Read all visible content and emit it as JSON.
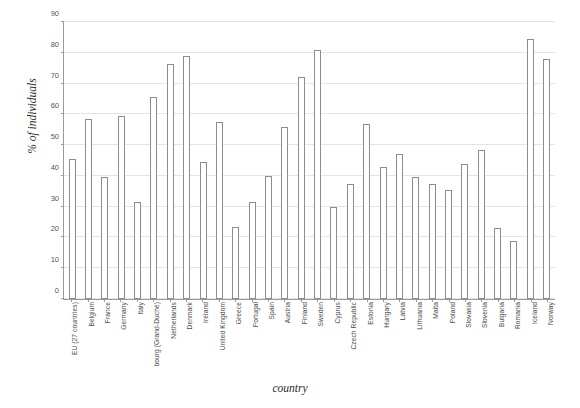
{
  "chart_data": {
    "type": "bar",
    "title": "",
    "xlabel": "country",
    "ylabel": "% of individuals",
    "ylim": [
      0,
      90
    ],
    "ytick_step": 10,
    "yticks": [
      0,
      10,
      20,
      30,
      40,
      50,
      60,
      70,
      80,
      90
    ],
    "grid": true,
    "legend": "none",
    "bar_fill_color": "#ffffff",
    "bar_border_color": "#8d8d8d",
    "gridline_color": "#e4e4e4",
    "axis_color": "#9a9a9a",
    "categories": [
      "EU (27 countries)",
      "Belgium",
      "France",
      "Germany",
      "Italy",
      "bourg (Grand-Duché)",
      "Netherlands",
      "Denmark",
      "Ireland",
      "United Kingdom",
      "Greece",
      "Portugal",
      "Spain",
      "Austria",
      "Finland",
      "Sweden",
      "Cyprus",
      "Czech Republic",
      "Estonia",
      "Hungary",
      "Latvia",
      "Lithuania",
      "Malta",
      "Poland",
      "Slovakia",
      "Slovenia",
      "Bulgaria",
      "Romania",
      "Iceland",
      "Norway"
    ],
    "values": [
      45.5,
      58.5,
      39.5,
      59.5,
      31.5,
      65.5,
      76.5,
      79.0,
      44.5,
      57.5,
      23.5,
      31.5,
      40.0,
      56.0,
      72.0,
      81.0,
      30.0,
      37.5,
      57.0,
      43.0,
      47.0,
      39.5,
      37.5,
      35.5,
      44.0,
      48.5,
      23.0,
      19.0,
      84.5,
      78.0
    ]
  }
}
